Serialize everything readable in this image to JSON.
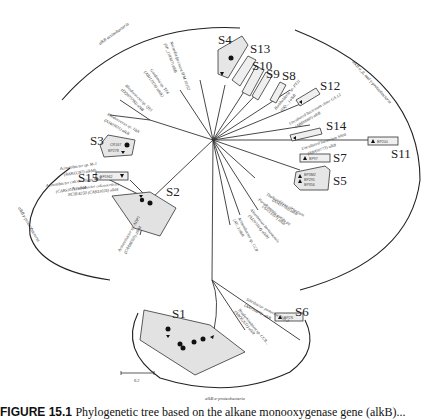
{
  "figure": {
    "caption_label": "FIGURE 15.1",
    "caption_text": "Phylogenetic tree based on the alkane monooxygenase gene (alkB)...",
    "scale_bar": "0.2"
  },
  "groups": {
    "actinobacteria": "alkB actinobacteria",
    "beta_gamma": "alkB α, β, and γ-proteobacteria",
    "gamma": "alkB γ-proteobacteria",
    "alpha": "alkB α-proteobacteria"
  },
  "clusters": [
    "S1",
    "S2",
    "S3",
    "S4",
    "S5",
    "S6",
    "S7",
    "S8",
    "S9",
    "S10",
    "S11",
    "S12",
    "S13",
    "S14",
    "S15"
  ],
  "references": {
    "r1": "Acinetobacter sp. M-1",
    "r1b": "(BAB33287) alkMb",
    "r2": "Acinetobacter calcoaceticus 69-V",
    "r2b": "(CAB51021) alkM",
    "r3": "Acinetobacter calcoaceticus",
    "r3b": "NCIB 8250 (CAB51025) alkM",
    "r4": "Acinetobacter sp. ADP1",
    "r4b": "(CAA86925) alkM",
    "r5": "Rhodococcus sp. 1BN",
    "r5b": "(AJ401611) alkB",
    "r6": "Rhodococcus sp. Q15",
    "r6b": "(DQ075780) alkB",
    "r7": "Gordonia sp. TF6",
    "r7b": "(AB112870) alkB2",
    "r8": "Nocardia farcinica IFM 10152",
    "r8b": "(YP_118307) alkB",
    "r9": "Mycobacterium sp. ...",
    "r10": "Thalassolituus oleivorans",
    "r10b": "(AJ431700) alkB",
    "r11": "Pseudomonas putida P1",
    "r11b": "(AJ233397) alkB",
    "r12": "Alcanivorax borkumensis",
    "r12b": "(AJ295164) alkB1",
    "r13": "Acinetobacter sp. CC8",
    "r13b": "(AY...) alkB",
    "r14": "Uncultured bacterium SA08",
    "r14b": "(ABA50773) alkB",
    "r15": "Uncultured bacterium clone GA 12",
    "r15b": "(ABI00080) alkB",
    "r16": "Burkholderia sp. PT11",
    "r16b": "(DQ... ) alkB",
    "r17": "Silicibacter pomeroyi DSS-3",
    "r17b": "(AAV96870) alkB",
    "r18": "Bradyrhizobium sp. CCB...",
    "r18b": "(ABO62611) alkB"
  },
  "boxes": {
    "S15": "EF5962",
    "S2": [
      "BP237",
      "CT60",
      "BP167",
      "CT115"
    ],
    "S3": [
      "CR167",
      "BP278"
    ],
    "S4": [
      "CT118",
      "CT186"
    ],
    "S13": "BP178",
    "S10": "BP180",
    "S9": "BP170",
    "S8": "BP193",
    "S12": "BP180",
    "S14": "BP377",
    "S7": "BP97",
    "S11": "BP200",
    "S5": [
      "BP3M2",
      "BP295",
      "BP356"
    ],
    "S6": "BP2S",
    "S1": [
      "CT302",
      "CT65",
      "BP192",
      "CT54",
      "BP33",
      "BP31",
      "CT137",
      "BP4",
      "CT96",
      "BP145"
    ]
  }
}
